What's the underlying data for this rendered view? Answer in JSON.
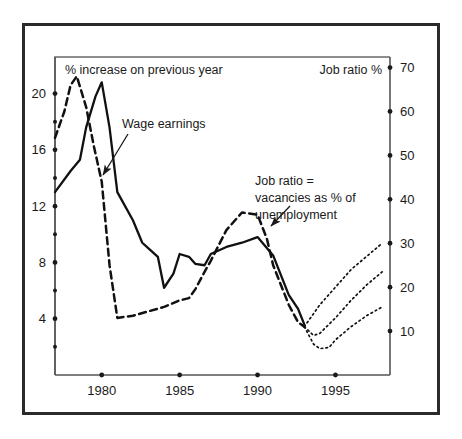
{
  "figure": {
    "title": "",
    "left_axis_caption": "% increase on previous year",
    "right_axis_caption": "Job ratio %"
  },
  "annotations": {
    "wage": {
      "text": "Wage earnings"
    },
    "jobratio": {
      "line1": "Job ratio =",
      "line2": "vacancies as % of",
      "line3": "unemployment"
    }
  },
  "colors": {
    "ink": "#1a1a1a",
    "frame": "#2b2b2b",
    "axis": "#555555",
    "background": "#ffffff"
  },
  "chart_data": {
    "type": "line",
    "title": "",
    "xlabel": "",
    "ylabel": "% increase on previous year",
    "y2label": "Job ratio %",
    "xlim": [
      1977,
      1998.5
    ],
    "ylim": [
      0,
      22.6
    ],
    "y2lim": [
      0,
      72.4
    ],
    "grid": false,
    "legend": "none",
    "xticks": [
      1980,
      1985,
      1990,
      1995
    ],
    "xticklabels": [
      "1980",
      "1985",
      "1990",
      "1995"
    ],
    "yticks_major": [
      4,
      8,
      12,
      16,
      20
    ],
    "yticklabels_major": [
      "4",
      "8",
      "12",
      "16",
      "20"
    ],
    "yticks_minor": [
      2,
      6,
      10,
      14,
      18
    ],
    "y2ticks": [
      10,
      20,
      30,
      40,
      50,
      60,
      70
    ],
    "y2ticklabels": [
      "10",
      "20",
      "30",
      "40",
      "50",
      "60",
      "70"
    ],
    "series": [
      {
        "name": "Wage earnings",
        "axis": "left",
        "style": "solid",
        "x": [
          1977,
          1978,
          1978.6,
          1979,
          1979.6,
          1980,
          1980.5,
          1981,
          1982,
          1982.6,
          1983,
          1983.6,
          1984,
          1984.6,
          1985,
          1985.6,
          1986,
          1986.6,
          1987,
          1988,
          1989,
          1990,
          1991,
          1992,
          1992.6,
          1993
        ],
        "y": [
          13.0,
          14.5,
          15.3,
          17.6,
          19.8,
          20.8,
          17.6,
          13.0,
          11.0,
          9.4,
          9.0,
          8.4,
          6.2,
          7.2,
          8.6,
          8.4,
          7.9,
          7.8,
          8.6,
          9.1,
          9.4,
          9.8,
          8.5,
          5.7,
          4.7,
          3.6
        ]
      },
      {
        "name": "Job ratio",
        "axis": "right",
        "style": "dashed",
        "x": [
          1977,
          1977.6,
          1978,
          1978.4,
          1979,
          1979.5,
          1980,
          1980.5,
          1981,
          1982,
          1983,
          1984,
          1985,
          1985.6,
          1986,
          1986.6,
          1987,
          1988,
          1989,
          1990,
          1990.6,
          1991,
          1992,
          1992.6,
          1993
        ],
        "y": [
          54.0,
          60.0,
          66.0,
          68.0,
          61.0,
          52.0,
          44.0,
          25.0,
          13.0,
          13.5,
          14.5,
          15.5,
          17.0,
          17.5,
          19.5,
          23.5,
          26.0,
          33.0,
          37.0,
          36.5,
          31.0,
          25.0,
          16.0,
          12.0,
          11.0
        ]
      },
      {
        "name": "Projection high",
        "axis": "right",
        "style": "dotted",
        "x": [
          1993,
          1993.6,
          1994,
          1995,
          1996,
          1997,
          1998
        ],
        "y": [
          11.0,
          14.0,
          16.0,
          20.0,
          24.0,
          27.0,
          30.0
        ]
      },
      {
        "name": "Projection mid",
        "axis": "right",
        "style": "dotted",
        "x": [
          1993,
          1993.6,
          1994,
          1995,
          1996,
          1997,
          1998
        ],
        "y": [
          11.0,
          9.0,
          9.5,
          13.0,
          17.0,
          20.5,
          23.5
        ]
      },
      {
        "name": "Projection low",
        "axis": "right",
        "style": "dotted",
        "x": [
          1993,
          1993.6,
          1994,
          1994.6,
          1995,
          1996,
          1997,
          1998
        ],
        "y": [
          11.0,
          7.0,
          6.0,
          6.3,
          8.0,
          11.0,
          13.5,
          15.5
        ]
      }
    ],
    "annotations": [
      {
        "text": "Wage earnings",
        "x": 1981.6,
        "y": 19.0,
        "arrow_to_x": 1980.4,
        "arrow_to_y": 15.5
      },
      {
        "text": "Job ratio = vacancies as % of unemployment",
        "x": 1989.5,
        "y": 14.0,
        "arrow_to_x": 1990.0,
        "arrow_to_y": 11.5
      }
    ]
  }
}
